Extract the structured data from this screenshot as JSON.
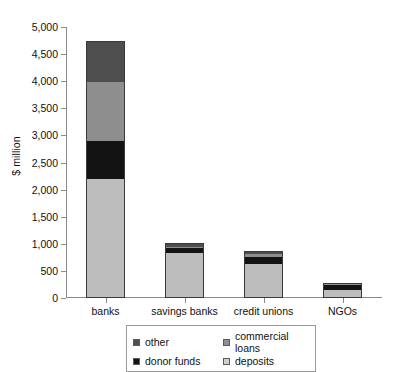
{
  "chart_data": {
    "type": "bar",
    "stacked": true,
    "title": "",
    "xlabel": "",
    "ylabel": "$ million",
    "ylim": [
      0,
      5000
    ],
    "ytick_step": 500,
    "grid": false,
    "legend_position": "bottom",
    "categories": [
      "banks",
      "savings banks",
      "credit unions",
      "NGOs"
    ],
    "ytick_labels": [
      "0",
      "500",
      "1,000",
      "1,500",
      "2,000",
      "2,500",
      "3,000",
      "3,500",
      "4,000",
      "4,500",
      "5,000"
    ],
    "ytick_values": [
      0,
      500,
      1000,
      1500,
      2000,
      2500,
      3000,
      3500,
      4000,
      4500,
      5000
    ],
    "series": [
      {
        "name": "deposits",
        "color": "#bdbdbd",
        "values": [
          2200,
          830,
          620,
          150
        ]
      },
      {
        "name": "donor funds",
        "color": "#131313",
        "values": [
          700,
          90,
          130,
          90
        ]
      },
      {
        "name": "commercial loans",
        "color": "#8e8e8e",
        "values": [
          1080,
          20,
          60,
          20
        ]
      },
      {
        "name": "other",
        "color": "#4e4e4e",
        "values": [
          770,
          80,
          60,
          20
        ]
      }
    ],
    "totals": [
      4750,
      1020,
      870,
      280
    ],
    "legend_entries": [
      {
        "label": "other",
        "color": "#4e4e4e"
      },
      {
        "label": "commercial loans",
        "color": "#8e8e8e"
      },
      {
        "label": "donor funds",
        "color": "#131313"
      },
      {
        "label": "deposits",
        "color": "#cfcfcf"
      }
    ]
  }
}
